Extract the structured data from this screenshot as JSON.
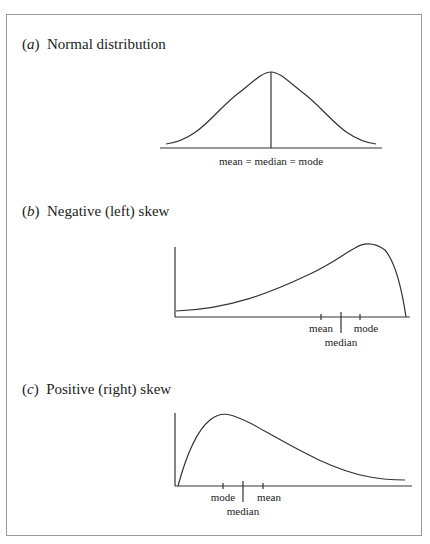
{
  "panels": [
    {
      "letter": "a",
      "title": "Normal distribution",
      "axis_label": "mean = median = mode"
    },
    {
      "letter": "b",
      "title": "Negative (left) skew",
      "labels": {
        "mean": "mean",
        "median": "median",
        "mode": "mode"
      }
    },
    {
      "letter": "c",
      "title": "Positive (right) skew",
      "labels": {
        "mode": "mode",
        "median": "median",
        "mean": "mean"
      }
    }
  ]
}
